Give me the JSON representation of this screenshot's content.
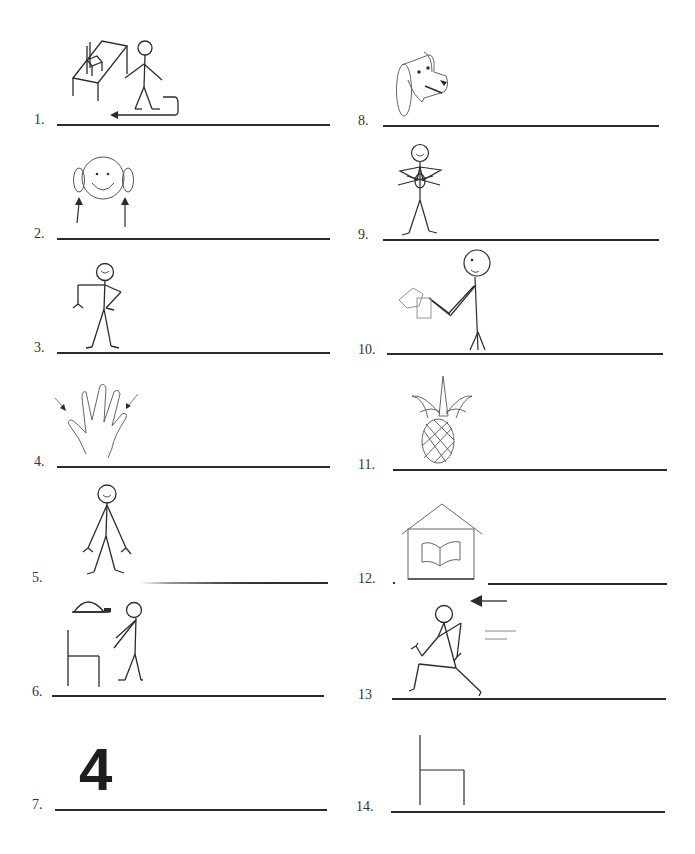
{
  "worksheet": {
    "items": [
      {
        "number": "1.",
        "picture": "stick-figure-pushing-chair-under-table"
      },
      {
        "number": "2.",
        "picture": "face-with-arrows-to-ears"
      },
      {
        "number": "3.",
        "picture": "stick-figure-hand-on-hip"
      },
      {
        "number": "4.",
        "picture": "hand-with-arrows"
      },
      {
        "number": "5.",
        "picture": "stick-figure-standing"
      },
      {
        "number": "6.",
        "picture": "stick-figure-turtle-and-chair"
      },
      {
        "number": "7.",
        "picture": "numeral-four",
        "glyph": "4"
      },
      {
        "number": "8.",
        "picture": "dog-head"
      },
      {
        "number": "9.",
        "picture": "stick-figure-arms-crossed"
      },
      {
        "number": "10.",
        "picture": "stick-figure-holding-paper"
      },
      {
        "number": "11.",
        "picture": "pineapple"
      },
      {
        "number": "12.",
        "picture": "house-with-book"
      },
      {
        "number": "13",
        "picture": "stick-figure-running-with-arrow"
      },
      {
        "number": "14.",
        "picture": "chair"
      }
    ]
  },
  "colors": {
    "ink": "#2b2b2b",
    "light_ink": "#777777",
    "background": "#ffffff"
  }
}
